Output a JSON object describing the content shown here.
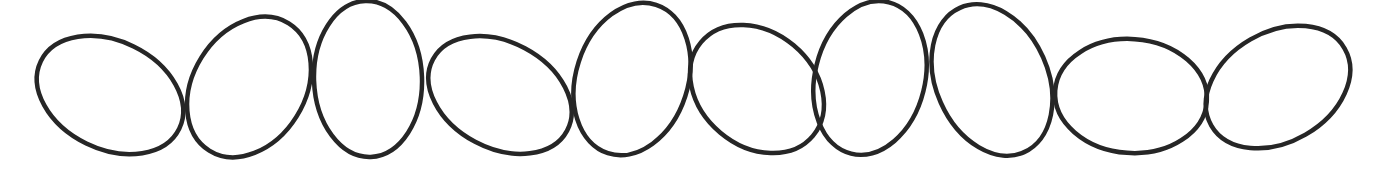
{
  "canvas": {
    "width": 1373,
    "height": 178,
    "background": "#ffffff",
    "stroke_color": "#262626",
    "stroke_width": 4.5
  },
  "ellipses": [
    {
      "cx": 110,
      "cy": 95,
      "rx": 77,
      "ry": 54,
      "rotate": 26
    },
    {
      "cx": 249,
      "cy": 87,
      "rx": 56,
      "ry": 75,
      "rotate": 32
    },
    {
      "cx": 368,
      "cy": 79,
      "rx": 54,
      "ry": 78,
      "rotate": -2
    },
    {
      "cx": 500,
      "cy": 95,
      "rx": 76,
      "ry": 53,
      "rotate": 28
    },
    {
      "cx": 632,
      "cy": 79,
      "rx": 56,
      "ry": 78,
      "rotate": 18
    },
    {
      "cx": 757,
      "cy": 89,
      "rx": 73,
      "ry": 57,
      "rotate": 40
    },
    {
      "cx": 870,
      "cy": 78,
      "rx": 55,
      "ry": 78,
      "rotate": 14
    },
    {
      "cx": 992,
      "cy": 80,
      "rx": 56,
      "ry": 79,
      "rotate": -24
    },
    {
      "cx": 1131,
      "cy": 96,
      "rx": 76,
      "ry": 57,
      "rotate": 4
    },
    {
      "cx": 1278,
      "cy": 87,
      "rx": 77,
      "ry": 55,
      "rotate": -30
    }
  ]
}
